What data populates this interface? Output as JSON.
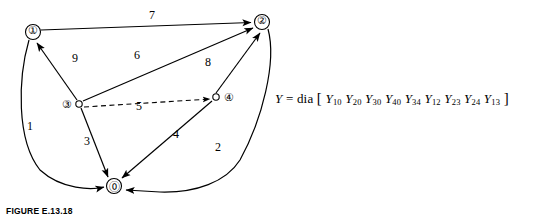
{
  "figure": {
    "caption": "FIGURE E.13.18"
  },
  "graph": {
    "nodes": [
      {
        "id": "1",
        "label": "①",
        "x": 33,
        "y": 32
      },
      {
        "id": "2",
        "label": "②",
        "x": 262,
        "y": 22
      },
      {
        "id": "3",
        "label": "③",
        "x": 68,
        "y": 104
      },
      {
        "id": "4",
        "label": "④",
        "x": 205,
        "y": 97
      },
      {
        "id": "0",
        "label": "⓪",
        "x": 114,
        "y": 186
      }
    ],
    "edges": [
      {
        "id": "e7",
        "label": "7",
        "from": "1",
        "to": "2",
        "label_x": 149,
        "label_y": 15
      },
      {
        "id": "e9",
        "label": "9",
        "from": "3",
        "to": "1",
        "label_x": 74,
        "label_y": 57
      },
      {
        "id": "e6",
        "label": "6",
        "from": "3",
        "to": "2",
        "label_x": 135,
        "label_y": 54
      },
      {
        "id": "e8",
        "label": "8",
        "from": "4",
        "to": "2",
        "label_x": 203,
        "label_y": 62
      },
      {
        "id": "e5",
        "label": "5",
        "from": "3",
        "to": "4",
        "label_x": 137,
        "label_y": 105
      },
      {
        "id": "e1",
        "label": "1",
        "from": "1",
        "to": "0",
        "label_x": 29,
        "label_y": 125
      },
      {
        "id": "e3",
        "label": "3",
        "from": "3",
        "to": "0",
        "label_x": 85,
        "label_y": 140
      },
      {
        "id": "e4",
        "label": "4",
        "from": "4",
        "to": "0",
        "label_x": 174,
        "label_y": 133
      },
      {
        "id": "e2",
        "label": "2",
        "from": "2",
        "to": "0",
        "label_x": 216,
        "label_y": 146
      }
    ]
  },
  "equation": {
    "lhs": "Y",
    "operator": "=",
    "function": "dia",
    "open_bracket": "[",
    "close_bracket": "]",
    "terms": [
      {
        "symbol": "Y",
        "sub": "10"
      },
      {
        "symbol": "Y",
        "sub": "20"
      },
      {
        "symbol": "Y",
        "sub": "30"
      },
      {
        "symbol": "Y",
        "sub": "40"
      },
      {
        "symbol": "Y",
        "sub": "34"
      },
      {
        "symbol": "Y",
        "sub": "12"
      },
      {
        "symbol": "Y",
        "sub": "23"
      },
      {
        "symbol": "Y",
        "sub": "24"
      },
      {
        "symbol": "Y",
        "sub": "13"
      }
    ]
  },
  "colors": {
    "ink": "#000000",
    "background": "#ffffff"
  }
}
